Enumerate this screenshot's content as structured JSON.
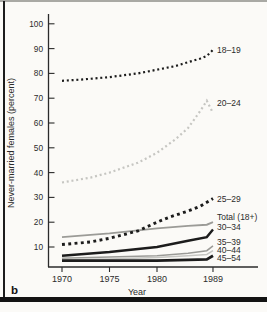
{
  "panel_label": "b",
  "colors": {
    "black_line": "#1c1c1c",
    "gray_medium": "#9b9b97",
    "gray_light": "#c6c6c2",
    "axis": "#2b2b2b",
    "frame_bottom": "#131313",
    "frame_top": "#a9a9a4",
    "background": "#fbfaf7"
  },
  "chart_data": {
    "type": "line",
    "title": "",
    "xlabel": "Year",
    "ylabel": "Never-married females (percent)",
    "x_ticks": [
      "1970",
      "1975",
      "1980",
      "1989"
    ],
    "y_ticks": [
      10,
      20,
      30,
      40,
      50,
      60,
      70,
      80,
      90,
      100
    ],
    "ylim": [
      2,
      103
    ],
    "grid": false,
    "legend_position": "inline-right",
    "series": [
      {
        "name": "18–19",
        "line_style": "dotted",
        "color": "#1c1c1c",
        "stroke_width": 2.2,
        "dash": "2 2.8",
        "points": [
          [
            1970,
            77
          ],
          [
            1972,
            77.5
          ],
          [
            1975,
            78.5
          ],
          [
            1978,
            80
          ],
          [
            1980,
            81.5
          ],
          [
            1983,
            83
          ],
          [
            1985,
            84.5
          ],
          [
            1987,
            86
          ],
          [
            1988,
            87
          ],
          [
            1989,
            89.5
          ]
        ]
      },
      {
        "name": "20–24",
        "line_style": "dotted",
        "color": "#c6c6c2",
        "stroke_width": 2.2,
        "dash": "2 2.8",
        "points": [
          [
            1970,
            36
          ],
          [
            1973,
            38
          ],
          [
            1975,
            40
          ],
          [
            1978,
            44
          ],
          [
            1980,
            48
          ],
          [
            1983,
            53.5
          ],
          [
            1985,
            58
          ],
          [
            1986,
            61.5
          ],
          [
            1987,
            65
          ],
          [
            1988,
            69
          ],
          [
            1989,
            64
          ]
        ]
      },
      {
        "name": "25–29",
        "line_style": "dotted",
        "color": "#1c1c1c",
        "stroke_width": 2.9,
        "dash": "2.9 3.4",
        "points": [
          [
            1970,
            11
          ],
          [
            1973,
            12
          ],
          [
            1975,
            13.5
          ],
          [
            1978,
            16.5
          ],
          [
            1980,
            20
          ],
          [
            1982,
            22
          ],
          [
            1985,
            24.5
          ],
          [
            1987,
            26.5
          ],
          [
            1989,
            29.5
          ]
        ]
      },
      {
        "name": "Total (18+)",
        "line_style": "solid",
        "color": "#9b9b97",
        "stroke_width": 1.9,
        "dash": "",
        "points": [
          [
            1970,
            14
          ],
          [
            1975,
            15.5
          ],
          [
            1980,
            17.5
          ],
          [
            1985,
            18.5
          ],
          [
            1988,
            19
          ],
          [
            1989,
            20
          ]
        ]
      },
      {
        "name": "30–34",
        "line_style": "solid",
        "color": "#1c1c1c",
        "stroke_width": 2.4,
        "dash": "",
        "points": [
          [
            1970,
            6.5
          ],
          [
            1975,
            8
          ],
          [
            1980,
            10
          ],
          [
            1985,
            12.5
          ],
          [
            1988,
            14
          ],
          [
            1989,
            17
          ]
        ]
      },
      {
        "name": "35–39",
        "line_style": "solid",
        "color": "#9b9b97",
        "stroke_width": 1.5,
        "dash": "",
        "points": [
          [
            1970,
            5.5
          ],
          [
            1975,
            6
          ],
          [
            1980,
            6.5
          ],
          [
            1985,
            7.5
          ],
          [
            1988,
            8.5
          ],
          [
            1989,
            10.5
          ]
        ]
      },
      {
        "name": "40–44",
        "line_style": "solid",
        "color": "#c6c6c2",
        "stroke_width": 1.5,
        "dash": "",
        "points": [
          [
            1970,
            5
          ],
          [
            1975,
            5.2
          ],
          [
            1980,
            5.8
          ],
          [
            1985,
            6.5
          ],
          [
            1988,
            7
          ],
          [
            1989,
            8.5
          ]
        ]
      },
      {
        "name": "45–54",
        "line_style": "solid",
        "color": "#1c1c1c",
        "stroke_width": 2.8,
        "dash": "",
        "points": [
          [
            1970,
            4.5
          ],
          [
            1975,
            4.5
          ],
          [
            1980,
            4.5
          ],
          [
            1985,
            4.8
          ],
          [
            1988,
            5
          ],
          [
            1989,
            6.5
          ]
        ]
      }
    ]
  }
}
